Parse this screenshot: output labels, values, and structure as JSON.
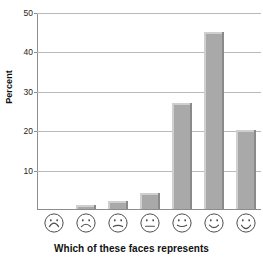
{
  "chart_data": {
    "type": "bar",
    "title": "",
    "subtitle": "",
    "xlabel": "Which of these faces represents",
    "ylabel": "Percent",
    "categories": [
      "very-sad-face",
      "sad-face",
      "slightly-sad-face",
      "neutral-face",
      "slightly-happy-face",
      "happy-face",
      "very-happy-face"
    ],
    "category_labels": [
      "",
      "",
      "",
      "",
      "",
      "",
      ""
    ],
    "values": [
      0,
      1,
      2,
      4,
      27,
      45,
      20
    ],
    "ylim": [
      0,
      50
    ],
    "yticks": [
      10,
      20,
      30,
      40,
      50
    ],
    "ytick_labels": [
      "10",
      "20",
      "30",
      "40",
      "50"
    ],
    "grid": "horizontal",
    "legend": "none",
    "bar_color": "#a9a9a9",
    "bar_highlight_color": "#cfcfcf",
    "bar_shadow_color": "#8a8a8a",
    "gridline_color": "#b9b9b9",
    "axis_color": "#8d8d8d",
    "background_color": "#ffffff",
    "text_color": "#111111"
  },
  "axis": {
    "y_title": "Percent",
    "x_title": "Which of these faces represents",
    "ticks": [
      {
        "value": 50,
        "label": "50"
      },
      {
        "value": 40,
        "label": "40"
      },
      {
        "value": 30,
        "label": "30"
      },
      {
        "value": 20,
        "label": "20"
      },
      {
        "value": 10,
        "label": "10"
      }
    ]
  },
  "faces": [
    {
      "name": "very-sad-face",
      "mood": "very-sad"
    },
    {
      "name": "sad-face",
      "mood": "sad"
    },
    {
      "name": "slightly-sad-face",
      "mood": "slightly-sad"
    },
    {
      "name": "neutral-face",
      "mood": "neutral"
    },
    {
      "name": "slightly-happy-face",
      "mood": "slightly-happy"
    },
    {
      "name": "happy-face",
      "mood": "happy"
    },
    {
      "name": "very-happy-face",
      "mood": "very-happy"
    }
  ]
}
